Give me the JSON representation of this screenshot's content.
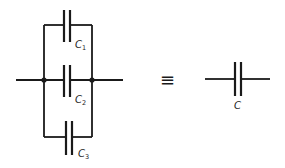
{
  "diagram": {
    "type": "circuit-schematic",
    "stroke_color": "#1a1a1a",
    "background": "#ffffff",
    "left_network": {
      "capacitors": [
        {
          "id": "C1",
          "label_main": "C",
          "label_sub": "1"
        },
        {
          "id": "C2",
          "label_main": "C",
          "label_sub": "2"
        },
        {
          "id": "C3",
          "label_main": "C",
          "label_sub": "3"
        }
      ]
    },
    "equivalence_symbol": "≡",
    "right_network": {
      "capacitor": {
        "id": "C",
        "label_main": "C"
      }
    }
  }
}
